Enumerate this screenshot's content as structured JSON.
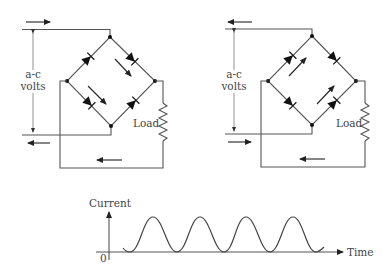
{
  "diagram": {
    "circuits": [
      {
        "id": "left-half-cycle",
        "source_label_line1": "a-c",
        "source_label_line2": "volts",
        "load_label": "Load",
        "input_top_arrow": "right",
        "input_bottom_arrow": "left",
        "return_arrow": "left",
        "conducting_path_arrows": [
          "down-right (top-right diode)",
          "down-right (bottom-left diode)"
        ]
      },
      {
        "id": "right-half-cycle",
        "source_label_line1": "a-c",
        "source_label_line2": "volts",
        "load_label": "Load",
        "input_top_arrow": "left",
        "input_bottom_arrow": "right",
        "return_arrow": "left",
        "conducting_path_arrows": [
          "up-right (top-left diode)",
          "up-right (bottom-right diode)"
        ]
      }
    ],
    "graph": {
      "y_label": "Current",
      "x_label": "Time",
      "origin_label": "0",
      "waveform": "rectified (unidirectional) pulsating current, 4 peaks"
    }
  },
  "colors": {
    "line": "#555555",
    "text": "#444444",
    "node": "#111111",
    "background": "#ffffff"
  }
}
